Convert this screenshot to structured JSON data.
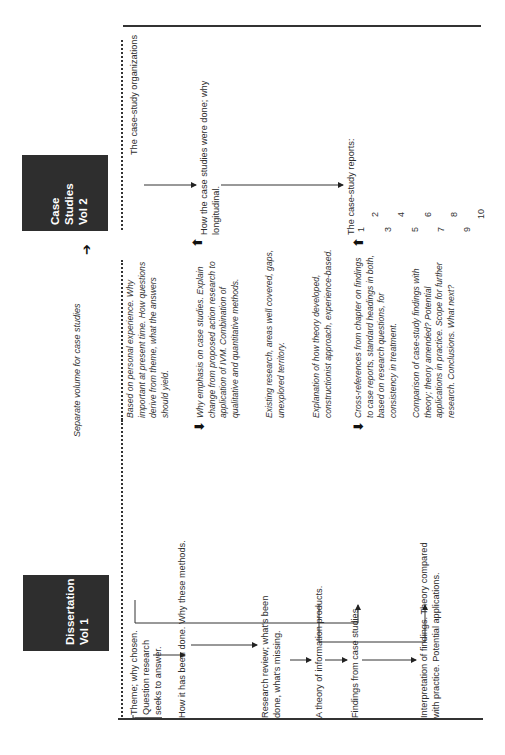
{
  "volumes": {
    "dissertation": {
      "title_line1": "Dissertation",
      "title_line2": "Vol 1"
    },
    "case_studies": {
      "title_line1": "Case",
      "title_line2": "Studies",
      "title_line3": "Vol 2"
    }
  },
  "separate_volume_note": "Separate volume for case studies",
  "dissertation_items": [
    {
      "text": "Theme; why chosen. Question research seeks to answer."
    },
    {
      "text": "How it has been done. Why these methods."
    },
    {
      "text": "Research review; what's been done, what's missing."
    },
    {
      "text": "A theory of information products."
    },
    {
      "text": "Findings from case studies."
    },
    {
      "text": "Interpretation of findings. Theory compared with practice. Potential applications."
    }
  ],
  "notes": [
    {
      "text": "Based on personal experience. Why important at present time. How questions derive from theme, what the answers should yield."
    },
    {
      "text": "Why emphasis on case studies. Explain change from proposed action research to application of IVM. Combination of qualitative and quantitative methods."
    },
    {
      "text": "Existing research, areas well covered, gaps, unexplored territory."
    },
    {
      "text": "Explanation of how theory developed, constructionist approach, experience-based."
    },
    {
      "text": "Cross-references from chapter on findings to case reports, standard headings in both, based on research questions, for consistency in treatment."
    },
    {
      "text": "Comparison of case-study findings with theory; theory amended? Potential applications in practice. Scope for further research. Conclusions. What next?"
    }
  ],
  "case_study_items": [
    {
      "text": "The case-study organizations"
    },
    {
      "text": "How the case studies were done; why longitudinal."
    },
    {
      "text": "The case-study reports:"
    }
  ],
  "report_numbers": [
    "1",
    "2",
    "3",
    "4",
    "5",
    "6",
    "7",
    "8",
    "9",
    "10"
  ],
  "colors": {
    "box": "#2e2e2e",
    "text": "#2d2d2d",
    "rule": "#333333"
  }
}
